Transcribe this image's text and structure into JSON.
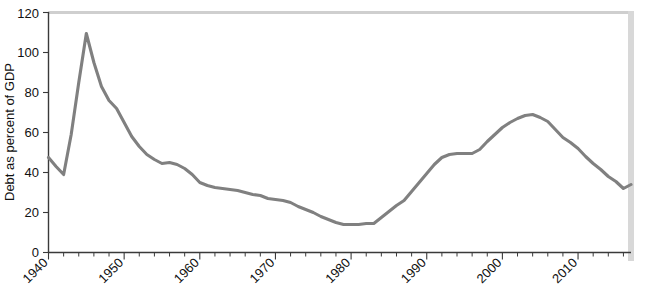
{
  "chart_data": {
    "type": "line",
    "title": "",
    "subtitle": "",
    "xlabel": "",
    "ylabel": "Debt as percent of GDP",
    "xlim": [
      1940,
      2013
    ],
    "ylim": [
      0,
      120
    ],
    "grid": false,
    "legend": null,
    "legend_position": "none",
    "y_ticks": [
      0,
      20,
      40,
      60,
      80,
      100,
      120
    ],
    "y_tick_labels": [
      "0",
      "20",
      "40",
      "60",
      "80",
      "100",
      "120"
    ],
    "x_ticks": [
      1940,
      1950,
      1960,
      1970,
      1980,
      1990,
      2000,
      2010
    ],
    "x_tick_labels": [
      "1940",
      "1950",
      "1960",
      "1970",
      "1980",
      "1990",
      "2000",
      "2010"
    ],
    "x_minor_tick_interval": 2,
    "line_color": "#808080",
    "axis_color": "#3a3a3a",
    "series": [
      {
        "name": "Debt as percent of GDP",
        "x": [
          1940,
          1941,
          1942,
          1943,
          1944,
          1945,
          1946,
          1947,
          1948,
          1949,
          1950,
          1951,
          1952,
          1953,
          1954,
          1955,
          1956,
          1957,
          1958,
          1959,
          1960,
          1961,
          1962,
          1963,
          1964,
          1965,
          1966,
          1967,
          1968,
          1969,
          1970,
          1971,
          1972,
          1973,
          1974,
          1975,
          1976,
          1977,
          1978,
          1979,
          1980,
          1981,
          1982,
          1983,
          1984,
          1985,
          1986,
          1987,
          1988,
          1989,
          1990,
          1991,
          1992,
          1993,
          1994,
          1995,
          1996,
          1997,
          1998,
          1999,
          2000,
          2001,
          2002,
          2003,
          2004,
          2005,
          2006,
          2007,
          2008,
          2009,
          2010,
          2011,
          2012,
          2013
        ],
        "values": [
          47.5,
          43.0,
          39.0,
          59.0,
          85.0,
          109.5,
          95.0,
          83.0,
          76.0,
          72.0,
          65.0,
          58.0,
          53.0,
          49.0,
          46.5,
          44.5,
          45.0,
          44.0,
          42.0,
          39.0,
          35.0,
          33.5,
          32.5,
          32.0,
          31.5,
          31.0,
          30.0,
          29.0,
          28.5,
          27.0,
          26.5,
          26.0,
          25.0,
          23.0,
          21.5,
          20.0,
          18.0,
          16.5,
          15.0,
          14.0,
          14.0,
          14.0,
          14.5,
          14.5,
          17.5,
          20.5,
          23.5,
          26.0,
          30.5,
          35.0,
          39.5,
          44.0,
          47.5,
          49.0,
          49.5,
          49.5,
          49.5,
          51.5,
          55.5,
          59.0,
          62.5,
          65.0,
          67.0,
          68.5,
          69.0,
          67.5,
          65.5,
          61.5,
          57.5,
          55.0,
          52.0,
          48.0,
          44.5,
          41.5
        ]
      }
    ],
    "series_extension": {
      "x": [
        2013,
        2014,
        2015,
        2016,
        2017
      ],
      "values": [
        41.5,
        38.0,
        35.5,
        32.0,
        34.0,
        34.0
      ]
    }
  },
  "axis": {
    "ylabel": "Debt as percent of GDP"
  }
}
